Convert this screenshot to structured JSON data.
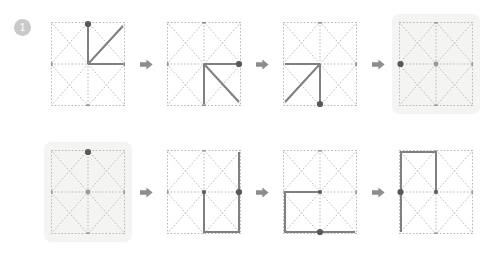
{
  "puzzle": {
    "title": "Shape rotation sequence puzzle",
    "grid": {
      "columns": 2,
      "rows": 2,
      "dotted_border": true,
      "diagonals": "x-per-cell",
      "grid_color": "#b9b9bb",
      "shape_color": "#808080",
      "dot_color": "#595959",
      "highlight_bg": "#f4f4f3"
    },
    "arrow_icon": "arrow-right-icon",
    "rows": [
      {
        "number": "1",
        "badge_label": "1",
        "panels": [
          {
            "index": "1",
            "label": "row-1-step-1",
            "highlighted": false,
            "is_answer_slot": false,
            "dot": "top-center",
            "shape_segments": [
              "center to top-center",
              "center to middle-right",
              "center to top-right diagonal"
            ]
          },
          {
            "index": "2",
            "label": "row-1-step-2",
            "highlighted": false,
            "is_answer_slot": false,
            "dot": "middle-right",
            "shape_segments": [
              "center to middle-right",
              "center to bottom-center",
              "center to bottom-right diagonal"
            ]
          },
          {
            "index": "3",
            "label": "row-1-step-3",
            "highlighted": false,
            "is_answer_slot": false,
            "dot": "bottom-center",
            "shape_segments": [
              "center to bottom-center",
              "center to middle-left",
              "center to bottom-left diagonal"
            ]
          },
          {
            "index": "4",
            "label": "row-1-answer",
            "highlighted": true,
            "is_answer_slot": true,
            "dot": "middle-left",
            "shape_segments": []
          }
        ]
      },
      {
        "number": "2",
        "badge_label": "2",
        "panels": [
          {
            "index": "1",
            "label": "row-2-answer",
            "highlighted": true,
            "is_answer_slot": true,
            "dot": "top-center",
            "shape_segments": []
          },
          {
            "index": "2",
            "label": "row-2-step-2",
            "highlighted": false,
            "is_answer_slot": false,
            "dot": "middle-right",
            "shape_segments": [
              "square in bottom-right quadrant"
            ]
          },
          {
            "index": "3",
            "label": "row-2-step-3",
            "highlighted": false,
            "is_answer_slot": false,
            "dot": "bottom-center",
            "shape_segments": [
              "square in bottom-left quadrant"
            ]
          },
          {
            "index": "4",
            "label": "row-2-step-4",
            "highlighted": false,
            "is_answer_slot": false,
            "dot": "middle-left",
            "shape_segments": [
              "square in top-left quadrant"
            ]
          }
        ]
      }
    ]
  }
}
